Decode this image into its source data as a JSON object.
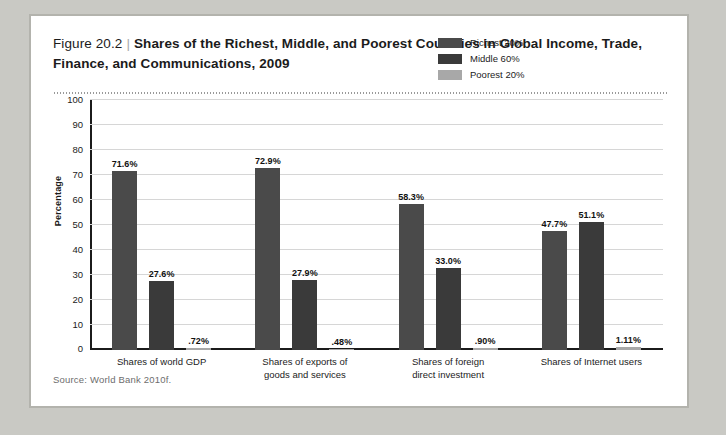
{
  "figure": {
    "number": "Figure 20.2",
    "separator": "|",
    "title": "Shares of the Richest, Middle, and Poorest Countries in Global Income, Trade, Finance, and Communications, 2009",
    "source": "Source: World Bank 2010f."
  },
  "colors": {
    "page_background": "#c9c9c4",
    "card_background": "#ffffff",
    "card_border": "#b3b3ad",
    "richest": "#4a4a4a",
    "middle": "#3a3a3a",
    "poorest": "#a8a8a8",
    "axis": "#1b1b1b",
    "gridline": "#d6d6d6"
  },
  "chart_data": {
    "type": "bar",
    "title": "Shares of the Richest, Middle, and Poorest Countries in Global Income, Trade, Finance, and Communications, 2009",
    "xlabel": "",
    "ylabel": "Percentage",
    "ylim": [
      0,
      100
    ],
    "yticks": [
      100,
      90,
      80,
      70,
      60,
      50,
      40,
      30,
      20,
      10,
      0
    ],
    "grid": true,
    "legend_position": "top-right",
    "categories": [
      "Shares of world GDP",
      "Shares of exports of\ngoods and services",
      "Shares of foreign\ndirect investment",
      "Shares of Internet users"
    ],
    "series": [
      {
        "name": "Richest 20%",
        "color": "#4a4a4a",
        "values": [
          71.6,
          72.9,
          58.3,
          47.7
        ],
        "labels": [
          "71.6%",
          "72.9%",
          "58.3%",
          "47.7%"
        ]
      },
      {
        "name": "Middle 60%",
        "color": "#3a3a3a",
        "values": [
          27.6,
          27.9,
          33.0,
          51.1
        ],
        "labels": [
          "27.6%",
          "27.9%",
          "33.0%",
          "51.1%"
        ]
      },
      {
        "name": "Poorest 20%",
        "color": "#a8a8a8",
        "values": [
          0.72,
          0.48,
          0.9,
          1.11
        ],
        "labels": [
          ".72%",
          ".48%",
          ".90%",
          "1.11%"
        ]
      }
    ]
  }
}
